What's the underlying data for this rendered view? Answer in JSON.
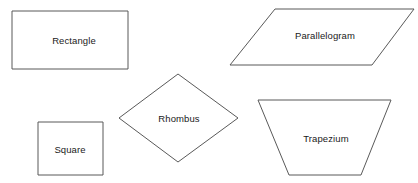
{
  "diagram": {
    "background_color": "#ffffff",
    "stroke_color": "#595959",
    "label_color": "#1a1a1a",
    "canvas": {
      "width": 418,
      "height": 183
    },
    "shapes": [
      {
        "id": "rectangle",
        "label": "Rectangle",
        "type": "rectangle",
        "points": "12,11 128,11 128,69 12,69",
        "label_x": 74,
        "label_y": 40
      },
      {
        "id": "parallelogram",
        "label": "Parallelogram",
        "type": "parallelogram",
        "points": "275,9 414,9 372,65 230,65",
        "label_x": 325,
        "label_y": 35
      },
      {
        "id": "rhombus",
        "label": "Rhombus",
        "type": "rhombus",
        "points": "178,74 238,118 178,162 119,118",
        "label_x": 179,
        "label_y": 118
      },
      {
        "id": "square",
        "label": "Square",
        "type": "square",
        "points": "38,122 103,122 103,175 38,175",
        "label_x": 70,
        "label_y": 149
      },
      {
        "id": "trapezium",
        "label": "Trapezium",
        "type": "trapezium",
        "points": "258,100 391,100 361,175 289,175",
        "label_x": 326,
        "label_y": 138
      }
    ]
  }
}
